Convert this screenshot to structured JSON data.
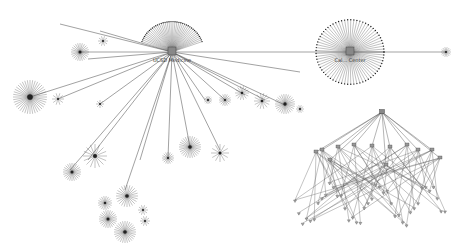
{
  "diagram": {
    "type": "network-graph",
    "background": "#ffffff",
    "edge_color": "#444444",
    "node_color": "#222222",
    "hubs": [
      {
        "id": "hub-left",
        "label": "UCSD Medicine",
        "x": 172,
        "y": 52,
        "fan_from": 200,
        "fan_to": 340,
        "fan_r": 32,
        "fan_n": 40
      },
      {
        "id": "hub-right",
        "label": "Cal... Center",
        "x": 350,
        "y": 52,
        "fan_from": 0,
        "fan_to": 360,
        "fan_r": 34,
        "fan_n": 70
      }
    ],
    "hub_link": {
      "from": [
        172,
        52
      ],
      "to": [
        446,
        52
      ]
    },
    "spokes_left": [
      [
        80,
        52
      ],
      [
        100,
        31
      ],
      [
        88,
        59
      ],
      [
        30,
        97
      ],
      [
        58,
        99
      ],
      [
        100,
        104
      ],
      [
        88,
        160
      ],
      [
        70,
        170
      ],
      [
        125,
        190
      ],
      [
        140,
        160
      ],
      [
        168,
        158
      ],
      [
        190,
        147
      ],
      [
        220,
        150
      ],
      [
        205,
        100
      ],
      [
        225,
        100
      ],
      [
        245,
        95
      ],
      [
        265,
        100
      ],
      [
        285,
        105
      ],
      [
        60,
        24
      ],
      [
        300,
        72
      ]
    ],
    "bursts": [
      {
        "x": 80,
        "y": 52,
        "r": 9,
        "n": 24
      },
      {
        "x": 30,
        "y": 97,
        "r": 17,
        "n": 40
      },
      {
        "x": 103,
        "y": 41,
        "r": 5,
        "n": 10
      },
      {
        "x": 58,
        "y": 99,
        "r": 6,
        "n": 10
      },
      {
        "x": 100,
        "y": 104,
        "r": 4,
        "n": 8
      },
      {
        "x": 95,
        "y": 156,
        "r": 12,
        "n": 16
      },
      {
        "x": 72,
        "y": 172,
        "r": 9,
        "n": 24
      },
      {
        "x": 127,
        "y": 196,
        "r": 11,
        "n": 24
      },
      {
        "x": 105,
        "y": 203,
        "r": 7,
        "n": 18
      },
      {
        "x": 108,
        "y": 219,
        "r": 9,
        "n": 24
      },
      {
        "x": 125,
        "y": 232,
        "r": 11,
        "n": 28
      },
      {
        "x": 145,
        "y": 221,
        "r": 5,
        "n": 10
      },
      {
        "x": 143,
        "y": 210,
        "r": 5,
        "n": 10
      },
      {
        "x": 168,
        "y": 158,
        "r": 6,
        "n": 16
      },
      {
        "x": 190,
        "y": 147,
        "r": 11,
        "n": 28
      },
      {
        "x": 220,
        "y": 153,
        "r": 9,
        "n": 12
      },
      {
        "x": 208,
        "y": 100,
        "r": 4,
        "n": 12
      },
      {
        "x": 225,
        "y": 100,
        "r": 6,
        "n": 16
      },
      {
        "x": 242,
        "y": 93,
        "r": 7,
        "n": 14
      },
      {
        "x": 262,
        "y": 101,
        "r": 8,
        "n": 14
      },
      {
        "x": 285,
        "y": 104,
        "r": 10,
        "n": 26
      },
      {
        "x": 300,
        "y": 109,
        "r": 4,
        "n": 10
      },
      {
        "x": 446,
        "y": 52,
        "r": 5,
        "n": 14
      }
    ],
    "tree": {
      "root": [
        382,
        112
      ],
      "mid": [
        [
          316,
          152
        ],
        [
          322,
          150
        ],
        [
          330,
          160
        ],
        [
          338,
          147
        ],
        [
          354,
          145
        ],
        [
          372,
          146
        ],
        [
          390,
          147
        ],
        [
          407,
          145
        ],
        [
          418,
          150
        ],
        [
          432,
          150
        ],
        [
          440,
          158
        ],
        [
          386,
          165
        ]
      ],
      "leaf_y": 200,
      "leaf_x_from": 295,
      "leaf_x_to": 445
    }
  }
}
